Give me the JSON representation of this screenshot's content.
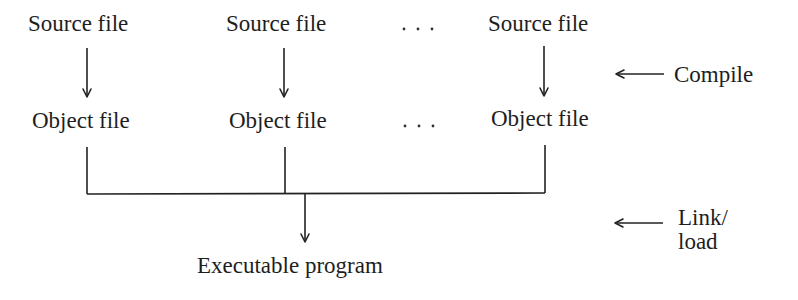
{
  "diagram": {
    "type": "flow",
    "title": "",
    "source_row": {
      "labels": [
        "Source file",
        "Source file",
        "Source file"
      ],
      "ellipsis": ". . ."
    },
    "object_row": {
      "labels": [
        "Object file",
        "Object file",
        "Object file"
      ],
      "ellipsis": ". . ."
    },
    "output": {
      "label": "Executable program"
    },
    "stages": [
      {
        "label": "Compile",
        "arrow": "left-arrow"
      },
      {
        "label_line1": "Link/",
        "label_line2": "load",
        "arrow": "left-arrow"
      }
    ],
    "edges": [
      {
        "from": "Source file 1",
        "to": "Object file 1"
      },
      {
        "from": "Source file 2",
        "to": "Object file 2"
      },
      {
        "from": "Source file 3",
        "to": "Object file 3"
      },
      {
        "from": "Object files",
        "to": "Executable program",
        "via": "merge-bracket"
      }
    ],
    "colors": {
      "ink": "#1e1e1e",
      "background": "#ffffff"
    }
  }
}
